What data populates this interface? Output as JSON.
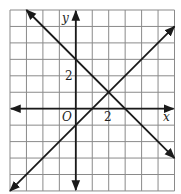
{
  "graph": {
    "grid": {
      "x_min": -4,
      "x_max": 6,
      "y_min": -5,
      "y_max": 6
    },
    "axis_labels": {
      "x": "x",
      "y": "y",
      "origin": "O"
    },
    "tick_labels": {
      "x_tick": "2",
      "y_tick": "2"
    },
    "lines": [
      {
        "name": "decreasing-line",
        "equation": "y = -x + 3",
        "from": [
          -3,
          6
        ],
        "to": [
          6,
          -3
        ]
      },
      {
        "name": "increasing-line",
        "equation": "y = x - 1",
        "from": [
          -4,
          -5
        ],
        "to": [
          6,
          5
        ]
      }
    ],
    "intersection": [
      2,
      1
    ],
    "colors": {
      "grid": "#8a8a8a",
      "axis": "#1a1a1a",
      "line": "#1a1a1a"
    }
  }
}
